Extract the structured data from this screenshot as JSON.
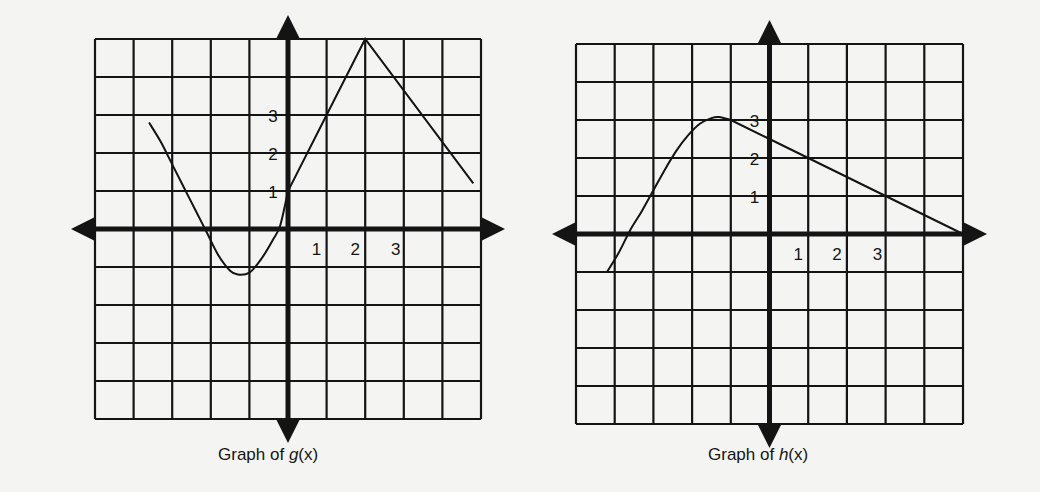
{
  "page": {
    "background": "#f4f4f2",
    "ink": "#141414"
  },
  "chart_data": [
    {
      "type": "line",
      "title": "Graph of g(x)",
      "caption": {
        "prefix": "Graph of ",
        "fn": "g",
        "suffix": "(x)"
      },
      "xlabel": "",
      "ylabel": "",
      "xlim": [
        -5,
        5
      ],
      "ylim": [
        -5,
        5
      ],
      "grid": true,
      "x_tick_labels": [
        "1",
        "2",
        "3"
      ],
      "y_tick_labels": [
        "1",
        "2",
        "3"
      ],
      "x_ticks": [
        1,
        2,
        3
      ],
      "y_ticks": [
        1,
        2,
        3
      ],
      "series": [
        {
          "name": "g(x)",
          "points": [
            [
              -3.6,
              2.8
            ],
            [
              -3.3,
              2.3
            ],
            [
              -3.0,
              1.7
            ],
            [
              -2.7,
              1.1
            ],
            [
              -2.4,
              0.5
            ],
            [
              -2.1,
              -0.1
            ],
            [
              -1.8,
              -0.7
            ],
            [
              -1.5,
              -1.1
            ],
            [
              -1.3,
              -1.2
            ],
            [
              -1.0,
              -1.15
            ],
            [
              -0.7,
              -0.8
            ],
            [
              -0.4,
              -0.3
            ],
            [
              -0.2,
              0.1
            ],
            [
              0.0,
              1.0
            ],
            [
              1.0,
              3.0
            ],
            [
              2.0,
              5.0
            ],
            [
              4.8,
              1.2
            ]
          ],
          "key_points": {
            "local_min": [
              -1.3,
              -1.2
            ],
            "y_intercept": [
              0,
              1
            ],
            "peak": [
              2,
              5
            ],
            "end": [
              4.8,
              1.2
            ]
          }
        }
      ]
    },
    {
      "type": "line",
      "title": "Graph of h(x)",
      "caption": {
        "prefix": "Graph of ",
        "fn": "h",
        "suffix": "(x)"
      },
      "xlabel": "",
      "ylabel": "",
      "xlim": [
        -5,
        5
      ],
      "ylim": [
        -5,
        5
      ],
      "grid": true,
      "x_tick_labels": [
        "1",
        "2",
        "3"
      ],
      "y_tick_labels": [
        "1",
        "2",
        "3"
      ],
      "x_ticks": [
        1,
        2,
        3
      ],
      "y_ticks": [
        1,
        2,
        3
      ],
      "series": [
        {
          "name": "h(x)",
          "points": [
            [
              -4.2,
              -1.0
            ],
            [
              -3.9,
              -0.5
            ],
            [
              -3.6,
              0.1
            ],
            [
              -3.3,
              0.6
            ],
            [
              -3.0,
              1.15
            ],
            [
              -2.7,
              1.7
            ],
            [
              -2.4,
              2.2
            ],
            [
              -2.1,
              2.6
            ],
            [
              -1.8,
              2.9
            ],
            [
              -1.5,
              3.05
            ],
            [
              -1.3,
              3.08
            ],
            [
              -1.0,
              3.0
            ],
            [
              0.0,
              2.5
            ],
            [
              1.0,
              2.0
            ],
            [
              3.0,
              1.0
            ],
            [
              5.0,
              0.0
            ]
          ],
          "key_points": {
            "max": [
              -1.3,
              3.1
            ],
            "y_intercept": [
              0,
              2.5
            ],
            "x_intercepts": [
              [
                -3.7,
                0
              ],
              [
                5,
                0
              ]
            ],
            "start": [
              -4.2,
              -1
            ]
          }
        }
      ]
    }
  ]
}
